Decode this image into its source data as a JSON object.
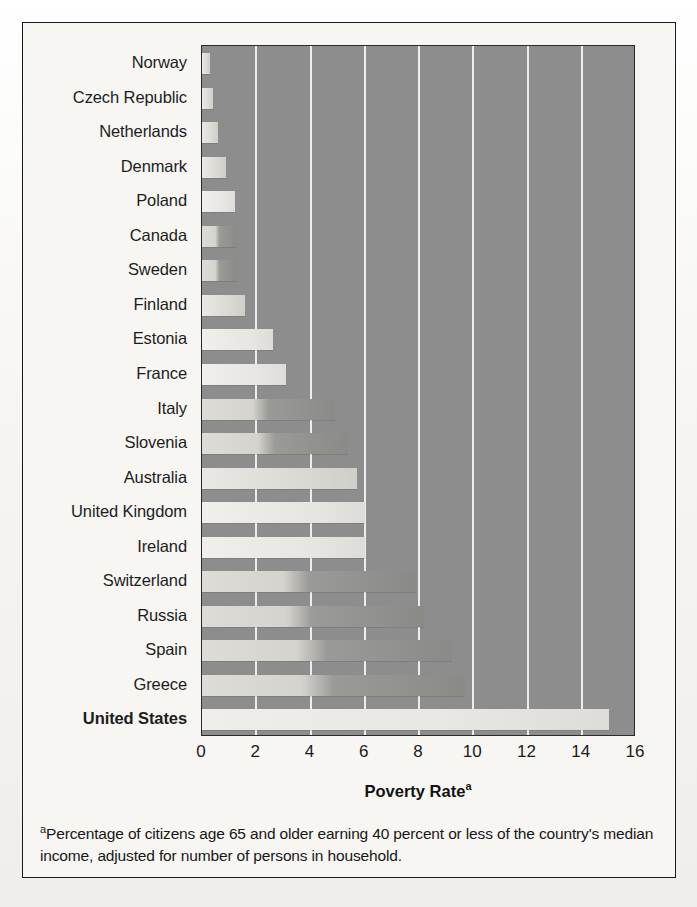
{
  "chart_data": {
    "type": "bar",
    "orientation": "horizontal",
    "title": "",
    "xlabel": "Poverty Rate",
    "xlabel_superscript": "a",
    "ylabel": "",
    "xlim": [
      0,
      16
    ],
    "xticks": [
      0,
      2,
      4,
      6,
      8,
      10,
      12,
      14,
      16
    ],
    "xtick_labels": [
      "0",
      "2",
      "4",
      "6",
      "8",
      "10",
      "12",
      "14",
      "16"
    ],
    "grid": "vertical-gridlines-at-xticks",
    "legend": "none",
    "categories": [
      "Norway",
      "Czech Republic",
      "Netherlands",
      "Denmark",
      "Poland",
      "Canada",
      "Sweden",
      "Finland",
      "Estonia",
      "France",
      "Italy",
      "Slovenia",
      "Australia",
      "United Kingdom",
      "Ireland",
      "Switzerland",
      "Russia",
      "Spain",
      "Greece",
      "United States"
    ],
    "values": [
      0.3,
      0.4,
      0.6,
      0.9,
      1.2,
      1.3,
      1.3,
      1.6,
      2.6,
      3.1,
      4.9,
      5.4,
      5.7,
      6.0,
      6.0,
      7.9,
      8.2,
      9.2,
      9.7,
      15.0
    ],
    "highlighted_category": "United States",
    "footnote_marker": "a",
    "footnote": "Percentage of citizens age 65 and older earning 40 percent or less of the country's median income, adjusted for number of persons in household."
  },
  "colors": {
    "plot_background": "#8d8d8d",
    "gridline": "#f2f2f2",
    "bar_light": "#e9e8e4",
    "bar_dark": "#8a8a87",
    "axis_text": "#1b1b1b",
    "frame": "#1b1b1b",
    "page_background": "#f7f6f3"
  }
}
